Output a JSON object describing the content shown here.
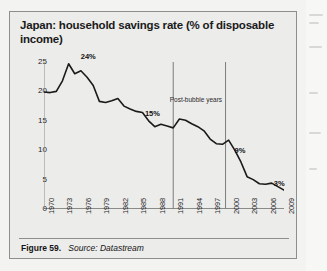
{
  "figure": {
    "title": "Japan: household savings rate (% of disposable income)",
    "caption_number": "Figure 59.",
    "caption_source": "Source: Datastream"
  },
  "chart_data": {
    "type": "line",
    "title": "Japan: household savings rate (% of disposable income)",
    "xlabel": "",
    "ylabel": "",
    "ylim": [
      0,
      25
    ],
    "xlim": [
      1970,
      2009
    ],
    "yticks": [
      0,
      5,
      10,
      15,
      20,
      25
    ],
    "ytick_labels": [
      "0",
      "5",
      "10",
      "15",
      "20",
      "25"
    ],
    "xticks": [
      1970,
      1973,
      1976,
      1979,
      1982,
      1985,
      1988,
      1991,
      1994,
      1997,
      2000,
      2003,
      2006,
      2009
    ],
    "xtick_labels": [
      "1970",
      "1973",
      "1976",
      "1979",
      "1982",
      "1985",
      "1988",
      "1991",
      "1994",
      "1997",
      "2000",
      "2003",
      "2006",
      "2009"
    ],
    "grid": false,
    "legend": false,
    "series": [
      {
        "name": "Household savings rate",
        "color": "#1a1a1a",
        "x": [
          1970,
          1971,
          1972,
          1973,
          1974,
          1975,
          1976,
          1977,
          1978,
          1979,
          1980,
          1981,
          1982,
          1983,
          1984,
          1985,
          1986,
          1987,
          1988,
          1989,
          1990,
          1991,
          1992,
          1993,
          1994,
          1995,
          1996,
          1997,
          1998,
          1999,
          2000,
          2001,
          2002,
          2003,
          2004,
          2005,
          2006,
          2007,
          2008,
          2009
        ],
        "values": [
          19.9,
          19.8,
          20.0,
          21.8,
          24.7,
          23.0,
          23.5,
          22.4,
          21.0,
          18.3,
          18.1,
          18.4,
          18.8,
          17.5,
          17.0,
          16.6,
          16.4,
          15.0,
          14.0,
          14.4,
          14.1,
          13.8,
          15.3,
          15.1,
          14.5,
          14.0,
          13.3,
          11.9,
          11.1,
          11.0,
          11.7,
          10.0,
          8.0,
          5.5,
          5.0,
          4.3,
          4.2,
          4.4,
          3.8,
          3.2
        ]
      }
    ],
    "annotations": [
      {
        "label": "24%",
        "x": 1975,
        "y": 24.7
      },
      {
        "label": "15%",
        "x": 1989,
        "y": 15.0
      },
      {
        "label": "9%",
        "x": 2000,
        "y": 9.0
      },
      {
        "label": "3%",
        "x": 2008,
        "y": 3.0
      },
      {
        "label": "Post-bubble years",
        "x": 1994,
        "y": 18.5
      }
    ],
    "vlines": [
      {
        "x": 1991,
        "label": "bubble-start"
      },
      {
        "x": 1999.5,
        "label": "bubble-end"
      }
    ]
  }
}
